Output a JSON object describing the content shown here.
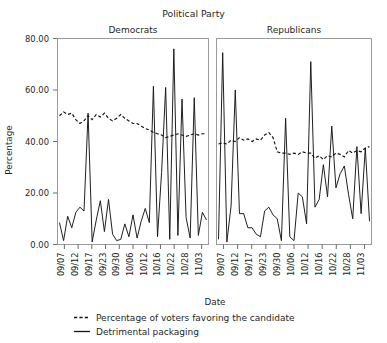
{
  "chart_data": {
    "type": "line",
    "title": "Political Party",
    "xlabel": "Date",
    "ylabel": "Percentage",
    "ylim": [
      0,
      80
    ],
    "yticks": [
      0,
      20,
      40,
      60,
      80
    ],
    "ytick_labels": [
      "0.00",
      "20.00",
      "40.00",
      "60.00",
      "80.00"
    ],
    "grid": false,
    "legend_position": "bottom-left",
    "panel_variable": "Political Party",
    "panels": [
      "Democrats",
      "Republicans"
    ],
    "categories": [
      "09/07",
      "09/12",
      "09/17",
      "09/23",
      "09/30",
      "10/06",
      "10/12",
      "10/16",
      "10/22",
      "10/28",
      "11/03"
    ],
    "x_range": [
      "09/05",
      "11/04"
    ],
    "legend": [
      {
        "name": "Percentage of voters favoring the candidate",
        "style": "dashed"
      },
      {
        "name": "Detrimental packaging",
        "style": "solid"
      }
    ],
    "panel_series": [
      {
        "panel": "Democrats",
        "series": [
          {
            "name": "Detrimental packaging",
            "style": "solid",
            "values": [
              8.5,
              1.5,
              11.0,
              6.5,
              12.5,
              14.5,
              13.0,
              51.0,
              1.0,
              9.5,
              17.0,
              5.0,
              17.5,
              4.0,
              1.5,
              2.0,
              8.0,
              3.0,
              11.5,
              2.5,
              9.0,
              14.0,
              8.5,
              61.5,
              3.0,
              28.0,
              61.0,
              2.0,
              76.0,
              3.5,
              56.5,
              10.5,
              2.5,
              57.0,
              3.5,
              12.5,
              9.5
            ]
          },
          {
            "name": "Percentage of voters favoring the candidate",
            "style": "dashed",
            "values": [
              50.0,
              51.5,
              50.5,
              51.0,
              48.5,
              47.0,
              48.0,
              50.0,
              48.5,
              50.5,
              49.5,
              51.0,
              49.0,
              48.0,
              49.0,
              50.5,
              49.0,
              48.0,
              47.0,
              47.0,
              46.0,
              45.0,
              44.5,
              43.5,
              43.0,
              42.5,
              41.5,
              42.0,
              42.5,
              43.0,
              42.5,
              42.0,
              42.5,
              43.0,
              42.5,
              43.0,
              43.0
            ]
          }
        ]
      },
      {
        "panel": "Republicans",
        "series": [
          {
            "name": "Detrimental packaging",
            "style": "solid",
            "values": [
              2.0,
              74.5,
              1.0,
              15.0,
              60.0,
              12.0,
              12.0,
              6.5,
              6.5,
              4.0,
              3.0,
              13.0,
              14.5,
              11.5,
              10.0,
              1.5,
              49.0,
              3.0,
              1.5,
              20.0,
              18.5,
              8.0,
              71.0,
              14.5,
              17.5,
              31.0,
              18.5,
              46.0,
              22.0,
              27.5,
              30.5,
              19.5,
              10.0,
              38.0,
              12.0,
              37.5,
              9.0
            ]
          },
          {
            "name": "Percentage of voters favoring the candidate",
            "style": "dashed",
            "values": [
              39.0,
              39.5,
              39.0,
              40.5,
              40.0,
              41.5,
              40.5,
              41.0,
              40.0,
              41.0,
              40.5,
              42.5,
              43.5,
              41.5,
              36.0,
              35.5,
              35.5,
              35.0,
              35.5,
              35.0,
              36.0,
              35.5,
              35.5,
              33.5,
              34.5,
              33.0,
              34.5,
              34.0,
              35.5,
              35.0,
              34.0,
              36.5,
              35.5,
              36.5,
              36.0,
              37.5,
              38.0
            ]
          }
        ]
      }
    ]
  }
}
